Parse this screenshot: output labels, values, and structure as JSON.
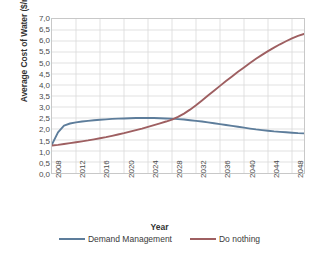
{
  "chart_data": {
    "type": "line",
    "title": "",
    "xlabel": "Year",
    "ylabel_text": "Average Cost of Water ($/m",
    "ylabel_sup": "3",
    "ylabel_tail": ")",
    "xlim": [
      2008,
      2050
    ],
    "ylim": [
      0.0,
      7.0
    ],
    "y_ticks": [
      "0,0",
      "0,5",
      "1,0",
      "1,5",
      "2,0",
      "2,5",
      "3,0",
      "3,5",
      "4,0",
      "4,5",
      "5,0",
      "5,5",
      "6,0",
      "6,5",
      "7,0"
    ],
    "y_tick_values": [
      0.0,
      0.5,
      1.0,
      1.5,
      2.0,
      2.5,
      3.0,
      3.5,
      4.0,
      4.5,
      5.0,
      5.5,
      6.0,
      6.5,
      7.0
    ],
    "x_ticks": [
      "2008",
      "2012",
      "2016",
      "2020",
      "2024",
      "2028",
      "2032",
      "2036",
      "2040",
      "2044",
      "2048"
    ],
    "x_tick_values": [
      2008,
      2012,
      2016,
      2020,
      2024,
      2028,
      2032,
      2036,
      2040,
      2044,
      2048
    ],
    "grid": true,
    "legend_position": "bottom",
    "colors": {
      "demand_management": "#5D7D9B",
      "do_nothing": "#9E5F61",
      "grid": "#d9d9d9",
      "axis": "#c8c8c8"
    },
    "x": [
      2008,
      2009,
      2010,
      2011,
      2012,
      2013,
      2014,
      2015,
      2016,
      2017,
      2018,
      2019,
      2020,
      2021,
      2022,
      2023,
      2024,
      2025,
      2026,
      2027,
      2028,
      2029,
      2030,
      2031,
      2032,
      2033,
      2034,
      2035,
      2036,
      2037,
      2038,
      2039,
      2040,
      2041,
      2042,
      2043,
      2044,
      2045,
      2046,
      2047,
      2048,
      2049,
      2050
    ],
    "series": [
      {
        "name": "Demand Management",
        "color": "#5D7D9B",
        "values": [
          1.3,
          1.85,
          2.15,
          2.25,
          2.3,
          2.34,
          2.37,
          2.4,
          2.42,
          2.44,
          2.46,
          2.47,
          2.48,
          2.49,
          2.5,
          2.5,
          2.5,
          2.5,
          2.49,
          2.48,
          2.47,
          2.45,
          2.43,
          2.4,
          2.37,
          2.34,
          2.3,
          2.26,
          2.22,
          2.18,
          2.14,
          2.1,
          2.06,
          2.02,
          1.98,
          1.95,
          1.92,
          1.89,
          1.87,
          1.85,
          1.83,
          1.81,
          1.8
        ]
      },
      {
        "name": "Do nothing",
        "color": "#9E5F61",
        "values": [
          1.25,
          1.28,
          1.32,
          1.36,
          1.4,
          1.44,
          1.48,
          1.53,
          1.58,
          1.63,
          1.69,
          1.75,
          1.81,
          1.88,
          1.95,
          2.02,
          2.1,
          2.18,
          2.26,
          2.34,
          2.43,
          2.55,
          2.7,
          2.88,
          3.08,
          3.3,
          3.52,
          3.74,
          3.96,
          4.18,
          4.39,
          4.6,
          4.8,
          5.0,
          5.19,
          5.37,
          5.54,
          5.7,
          5.85,
          5.99,
          6.12,
          6.23,
          6.32
        ]
      }
    ],
    "annotations": {
      "crossover_year": 2031,
      "crossover_value": 2.39
    }
  },
  "legend": {
    "entries": [
      {
        "label": "Demand Management",
        "color": "#5D7D9B"
      },
      {
        "label": "Do nothing",
        "color": "#9E5F61"
      }
    ]
  }
}
